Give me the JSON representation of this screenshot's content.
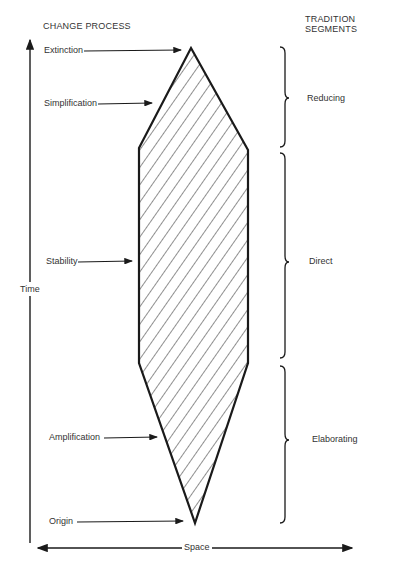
{
  "headers": {
    "left": "CHANGE PROCESS",
    "right": "TRADITION SEGMENTS"
  },
  "change_process": [
    {
      "label": "Extinction"
    },
    {
      "label": "Simplification"
    },
    {
      "label": "Stability"
    },
    {
      "label": "Amplification"
    },
    {
      "label": "Origin"
    }
  ],
  "tradition_segments": [
    {
      "label": "Reducing"
    },
    {
      "label": "Direct"
    },
    {
      "label": "Elaborating"
    }
  ],
  "axes": {
    "vertical": "Time",
    "horizontal": "Space"
  },
  "colors": {
    "ink": "#1a1a1a",
    "background": "#ffffff"
  }
}
